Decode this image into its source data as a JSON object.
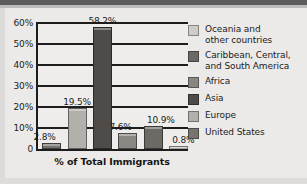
{
  "chart_data": {
    "type": "bar",
    "title": "",
    "xlabel": "% of Total Immigrants",
    "ylabel": "",
    "ylim": [
      0,
      60
    ],
    "grid": true,
    "legend_position": "right",
    "categories": [
      "United States",
      "Europe",
      "Asia",
      "Africa",
      "Caribbean, Central, and South America",
      "Oceania and other countries"
    ],
    "values": [
      2.8,
      19.5,
      58.2,
      7.6,
      10.9,
      0.8
    ],
    "data_labels": [
      "2.8%",
      "19.5%",
      "58.2%",
      "7.6%",
      "10.9%",
      "0.8%"
    ],
    "bar_colors": [
      "#77736f",
      "#b3b0ac",
      "#4e4b48",
      "#8a8783",
      "#6d6a66",
      "#cfccc8"
    ],
    "y_ticks": [
      {
        "value": 60,
        "label": "60%"
      },
      {
        "value": 50,
        "label": "50%"
      },
      {
        "value": 40,
        "label": "40%"
      },
      {
        "value": 30,
        "label": "30%"
      },
      {
        "value": 20,
        "label": "20%"
      },
      {
        "value": 10,
        "label": "10%"
      },
      {
        "value": 0,
        "label": "0"
      }
    ],
    "legend": [
      {
        "label": "Oceania and other countries",
        "color": "#cfccc8"
      },
      {
        "label": "Caribbean, Central, and South America",
        "color": "#6d6a66"
      },
      {
        "label": "Africa",
        "color": "#8a8783"
      },
      {
        "label": "Asia",
        "color": "#4e4b48"
      },
      {
        "label": "Europe",
        "color": "#b3b0ac"
      },
      {
        "label": "United States",
        "color": "#77736f"
      }
    ]
  },
  "legend_lines": {
    "oceania_1": "Oceania and",
    "oceania_2": "other countries",
    "caribbean_1": "Caribbean, Central,",
    "caribbean_2": "and South America",
    "africa": "Africa",
    "asia": "Asia",
    "europe": "Europe",
    "united_states": "United States"
  }
}
